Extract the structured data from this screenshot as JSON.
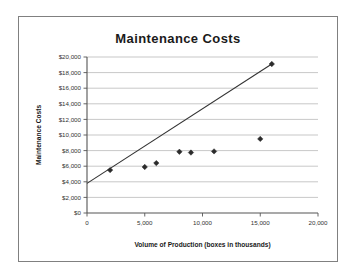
{
  "figure": {
    "title": "Maintenance Costs"
  },
  "chart_data": {
    "type": "scatter",
    "title": "Maintenance Costs",
    "xlabel": "Volume of Production (boxes in thousands)",
    "ylabel": "Maintenance Costs",
    "xlim": [
      0,
      20000
    ],
    "ylim": [
      0,
      20000
    ],
    "grid": "horizontal",
    "legend": "none",
    "x_ticks": [
      0,
      5000,
      10000,
      15000,
      20000
    ],
    "x_tick_labels": [
      "0",
      "5,000",
      "10,000",
      "15,000",
      "20,000"
    ],
    "y_ticks": [
      0,
      2000,
      4000,
      6000,
      8000,
      10000,
      12000,
      14000,
      16000,
      18000,
      20000
    ],
    "y_tick_labels": [
      "$0",
      "$2,000",
      "$4,000",
      "$6,000",
      "$8,000",
      "$10,000",
      "$12,000",
      "$14,000",
      "$16,000",
      "$18,000",
      "$20,000"
    ],
    "series": [
      {
        "name": "Maintenance Costs",
        "marker": "diamond",
        "color": "#2b2b2b",
        "points": [
          {
            "x": 2000,
            "y": 5500
          },
          {
            "x": 5000,
            "y": 5900
          },
          {
            "x": 6000,
            "y": 6400
          },
          {
            "x": 8000,
            "y": 7850
          },
          {
            "x": 9000,
            "y": 7750
          },
          {
            "x": 11000,
            "y": 7900
          },
          {
            "x": 15000,
            "y": 9500
          },
          {
            "x": 16000,
            "y": 19100
          }
        ]
      }
    ],
    "trend_line": {
      "name": "high-low fit line",
      "color": "#333333",
      "from": {
        "x": 0,
        "y": 3800
      },
      "to": {
        "x": 16000,
        "y": 19100
      }
    }
  }
}
